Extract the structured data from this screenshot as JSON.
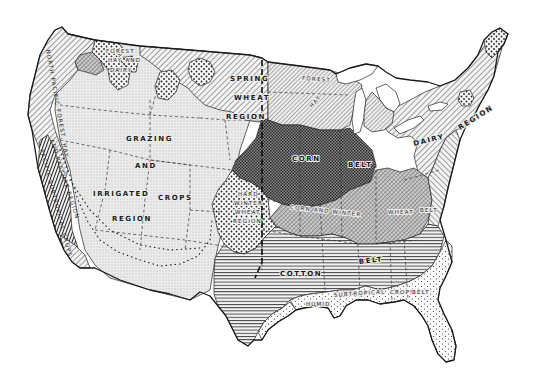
{
  "map": {
    "subject": "Agricultural regions of the United States",
    "style": "black-and-white hatched map",
    "colors": {
      "background": "#ffffff",
      "ink": "#1a1a1a",
      "land_light": "#ececec"
    },
    "regions": [
      {
        "id": "grazing",
        "label_lines": [
          "GRAZING",
          "AND",
          "IRRIGATED CROPS",
          "REGION"
        ],
        "pattern": "fine-stipple"
      },
      {
        "id": "spring-wheat",
        "label_lines": [
          "SPRING",
          "WHEAT",
          "REGION"
        ],
        "pattern": "diagonal-hatch"
      },
      {
        "id": "hard-winter-wheat",
        "label_lines": [
          "HARD",
          "WINTER",
          "WHEAT",
          "REGION"
        ],
        "pattern": "coarse-dots"
      },
      {
        "id": "corn-belt",
        "label_lines": [
          "CORN",
          "BELT"
        ],
        "pattern": "dense-crosshatch"
      },
      {
        "id": "corn-and-winter-wheat",
        "label_lines": [
          "CORN AND WINTER",
          "WHEAT",
          "BELT"
        ],
        "pattern": "cross-diagonal"
      },
      {
        "id": "cotton-belt",
        "label_lines": [
          "COTTON",
          "BELT"
        ],
        "pattern": "horizontal-lines"
      },
      {
        "id": "dairy",
        "label_lines": [
          "DAIRY",
          "REGION"
        ],
        "pattern": "diagonal-hatch"
      },
      {
        "id": "hay-and-dairy",
        "label_lines": [
          "HAY",
          "AND",
          "DAIRY"
        ],
        "pattern": "diagonal-hatch-fine"
      },
      {
        "id": "humid-subtropical-crops",
        "label_lines": [
          "HUMID",
          "SUBTROPICAL",
          "CROPS",
          "BELT"
        ],
        "pattern": "sparse-dots"
      },
      {
        "id": "north-pacific-forest",
        "label_lines": [
          "NORTH PACIFIC",
          "FOREST, HAY",
          "AND PASTURE REGION"
        ],
        "pattern": "diagonal-hatch"
      },
      {
        "id": "pacific-subtropical",
        "label_lines": [
          "PACIFIC",
          "SUBTROPICAL",
          "CROPS"
        ],
        "pattern": "vertical-lines"
      },
      {
        "id": "forest-hay-and-dairy",
        "label_lines": [
          "FOREST",
          "HAY",
          "AND",
          "DAIRY"
        ],
        "pattern": "coarse-dots"
      },
      {
        "id": "forest-and-hay",
        "label_lines": [
          "FOREST",
          "AND HAY"
        ],
        "pattern": "dotted-border"
      }
    ],
    "labels": {
      "grazing_1": "GRAZING",
      "grazing_2": "AND",
      "grazing_3a": "IRRIGATED",
      "grazing_3b": "CROPS",
      "grazing_4": "REGION",
      "spring_1": "SPRING",
      "spring_2": "WHEAT",
      "spring_3": "REGION",
      "hard_1": "HARD",
      "hard_2": "WINTER",
      "hard_3": "WHEAT",
      "hard_4": "REGION",
      "corn_1": "CORN",
      "corn_2": "BELT",
      "cww_1": "CORN AND WINTER",
      "cww_2": "WHEAT",
      "cww_3": "BELT",
      "cotton_1": "COTTON",
      "cotton_2": "BELT",
      "dairy_1": "DAIRY",
      "dairy_2": "REGION",
      "hay_1": "HAY",
      "subtrop_1": "HUMID",
      "subtrop_2": "SUBTROPICAL",
      "subtrop_3": "CROPS",
      "subtrop_4": "BELT",
      "pacific_1": "NORTH PACIFIC FOREST, HAY",
      "pacific_2": "AND PASTURE REGION",
      "pacsub_1": "PACIFIC SUBTROPICAL CROPS",
      "forest_1": "FOREST",
      "forest_2": "HAY AND",
      "forest_3": "DAIRY",
      "forest_top": "FOREST"
    }
  }
}
